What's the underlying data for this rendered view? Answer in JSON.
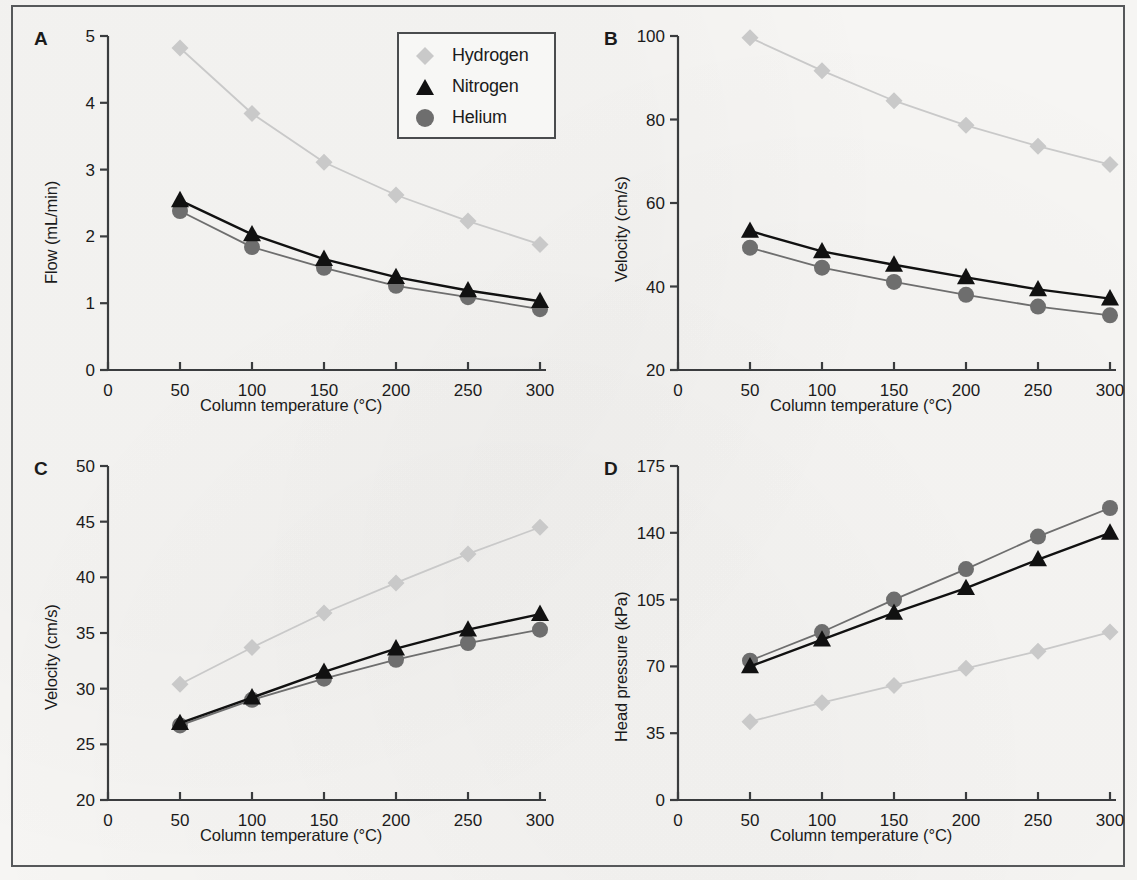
{
  "figure": {
    "background_color": "#f6f5f3",
    "frame_color": "#56585a",
    "series_colors": {
      "hydrogen": "#c9c9c9",
      "nitrogen": "#111111",
      "helium": "#6e6e6e"
    }
  },
  "legend": {
    "position": "panel-a-top-right",
    "entries": [
      {
        "label": "Hydrogen",
        "marker": "diamond",
        "color": "#c9c9c9"
      },
      {
        "label": "Nitrogen",
        "marker": "triangle",
        "color": "#111111"
      },
      {
        "label": "Helium",
        "marker": "circle",
        "color": "#6e6e6e"
      }
    ]
  },
  "chart_data": [
    {
      "panel": "A",
      "type": "line",
      "title": "",
      "xlabel": "Column temperature (°C)",
      "ylabel": "Flow (mL/min)",
      "x": [
        50,
        100,
        150,
        200,
        250,
        300
      ],
      "xlim": [
        0,
        300
      ],
      "xticks": [
        0,
        50,
        100,
        150,
        200,
        250,
        300
      ],
      "xticklabels": [
        "0",
        "50",
        "100",
        "150",
        "200",
        "250",
        "300"
      ],
      "ylim": [
        0,
        5
      ],
      "yticks": [
        0,
        1,
        2,
        3,
        4,
        5
      ],
      "yticklabels": [
        "0",
        "1",
        "2",
        "3",
        "4",
        "5"
      ],
      "grid": false,
      "series": [
        {
          "name": "Hydrogen",
          "marker": "diamond",
          "color": "#c9c9c9",
          "values": [
            4.82,
            3.84,
            3.11,
            2.62,
            2.23,
            1.88
          ]
        },
        {
          "name": "Nitrogen",
          "marker": "triangle",
          "color": "#111111",
          "values": [
            2.54,
            2.03,
            1.66,
            1.39,
            1.19,
            1.03
          ]
        },
        {
          "name": "Helium",
          "marker": "circle",
          "color": "#6e6e6e",
          "values": [
            2.38,
            1.84,
            1.53,
            1.26,
            1.09,
            0.91
          ]
        }
      ]
    },
    {
      "panel": "B",
      "type": "line",
      "title": "",
      "xlabel": "Column temperature (°C)",
      "ylabel": "Velocity (cm/s)",
      "x": [
        50,
        100,
        150,
        200,
        250,
        300
      ],
      "xlim": [
        0,
        300
      ],
      "xticks": [
        0,
        50,
        100,
        150,
        200,
        250,
        300
      ],
      "xticklabels": [
        "0",
        "50",
        "100",
        "150",
        "200",
        "250",
        "300"
      ],
      "ylim": [
        20,
        100
      ],
      "yticks": [
        20,
        40,
        60,
        80,
        100
      ],
      "yticklabels": [
        "20",
        "40",
        "60",
        "80",
        "100"
      ],
      "grid": false,
      "series": [
        {
          "name": "Hydrogen",
          "marker": "diamond",
          "color": "#c9c9c9",
          "values": [
            99.6,
            91.7,
            84.5,
            78.6,
            73.6,
            69.2
          ]
        },
        {
          "name": "Nitrogen",
          "marker": "triangle",
          "color": "#111111",
          "values": [
            53.3,
            48.4,
            45.2,
            42.2,
            39.3,
            37.1
          ]
        },
        {
          "name": "Helium",
          "marker": "circle",
          "color": "#6e6e6e",
          "values": [
            49.3,
            44.5,
            41.1,
            38.0,
            35.2,
            33.1
          ]
        }
      ]
    },
    {
      "panel": "C",
      "type": "line",
      "title": "",
      "xlabel": "Column temperature (°C)",
      "ylabel": "Velocity (cm/s)",
      "x": [
        50,
        100,
        150,
        200,
        250,
        300
      ],
      "xlim": [
        0,
        300
      ],
      "xticks": [
        0,
        50,
        100,
        150,
        200,
        250,
        300
      ],
      "xticklabels": [
        "0",
        "50",
        "100",
        "150",
        "200",
        "250",
        "300"
      ],
      "ylim": [
        20,
        50
      ],
      "yticks": [
        20,
        25,
        30,
        35,
        40,
        45,
        50
      ],
      "yticklabels": [
        "20",
        "25",
        "30",
        "35",
        "40",
        "45",
        "50"
      ],
      "grid": false,
      "series": [
        {
          "name": "Hydrogen",
          "marker": "diamond",
          "color": "#c9c9c9",
          "values": [
            30.4,
            33.7,
            36.8,
            39.5,
            42.1,
            44.5
          ]
        },
        {
          "name": "Nitrogen",
          "marker": "triangle",
          "color": "#111111",
          "values": [
            26.9,
            29.2,
            31.5,
            33.6,
            35.3,
            36.7
          ]
        },
        {
          "name": "Helium",
          "marker": "circle",
          "color": "#6e6e6e",
          "values": [
            26.7,
            29.0,
            30.9,
            32.6,
            34.1,
            35.3
          ]
        }
      ]
    },
    {
      "panel": "D",
      "type": "line",
      "title": "",
      "xlabel": "Column temperature (°C)",
      "ylabel": "Head pressure (kPa)",
      "x": [
        50,
        100,
        150,
        200,
        250,
        300
      ],
      "xlim": [
        0,
        300
      ],
      "xticks": [
        0,
        50,
        100,
        150,
        200,
        250,
        300
      ],
      "xticklabels": [
        "0",
        "50",
        "100",
        "150",
        "200",
        "250",
        "300"
      ],
      "ylim": [
        0,
        175
      ],
      "yticks": [
        0,
        35,
        70,
        105,
        140,
        175
      ],
      "yticklabels": [
        "0",
        "35",
        "70",
        "105",
        "140",
        "175"
      ],
      "grid": false,
      "series": [
        {
          "name": "Hydrogen",
          "marker": "diamond",
          "color": "#c9c9c9",
          "values": [
            41,
            51,
            60,
            69,
            78,
            88
          ]
        },
        {
          "name": "Nitrogen",
          "marker": "triangle",
          "color": "#111111",
          "values": [
            70,
            84,
            98,
            111,
            126,
            140
          ]
        },
        {
          "name": "Helium",
          "marker": "circle",
          "color": "#6e6e6e",
          "values": [
            73,
            88,
            105,
            121,
            138,
            153
          ]
        }
      ]
    }
  ]
}
